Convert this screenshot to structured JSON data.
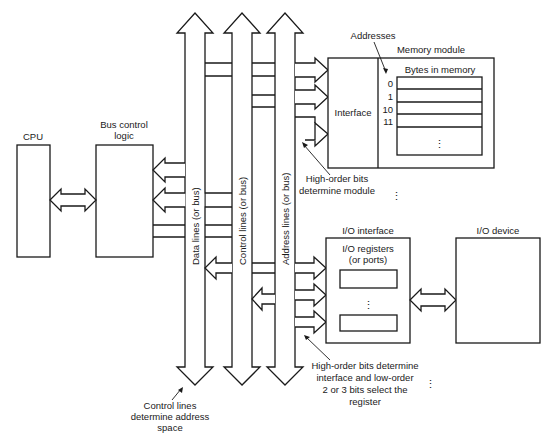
{
  "diagram": {
    "type": "computer bus architecture",
    "blocks": {
      "cpu": {
        "label": "CPU"
      },
      "bus_control": {
        "label_line1": "Bus control",
        "label_line2": "logic"
      },
      "memory_module": {
        "label": "Memory module",
        "interface_label": "Interface",
        "bytes_label": "Bytes in memory",
        "addresses_label": "Addresses",
        "addresses": [
          "0",
          "1",
          "10",
          "11"
        ],
        "ellipsis": "⋮"
      },
      "io_interface": {
        "label": "I/O interface",
        "registers_line1": "I/O registers",
        "registers_line2": "(or ports)",
        "ellipsis": "⋮"
      },
      "io_device": {
        "label": "I/O device"
      }
    },
    "buses": {
      "data": {
        "label": "Data lines (or bus)"
      },
      "control": {
        "label": "Control lines (or bus)"
      },
      "address": {
        "label": "Address lines (or bus)"
      }
    },
    "annotations": {
      "high_order_module_line1": "High-order bits",
      "high_order_module_line2": "determine module",
      "io_select_line1": "High-order bits determine",
      "io_select_line2": "interface and low-order",
      "io_select_line3": "2 or 3 bits select the",
      "io_select_line4": "register",
      "control_space_line1": "Control lines",
      "control_space_line2": "determine address",
      "control_space_line3": "space",
      "more_modules_ellipsis": "⋮",
      "more_interfaces_ellipsis": "⋮"
    }
  }
}
